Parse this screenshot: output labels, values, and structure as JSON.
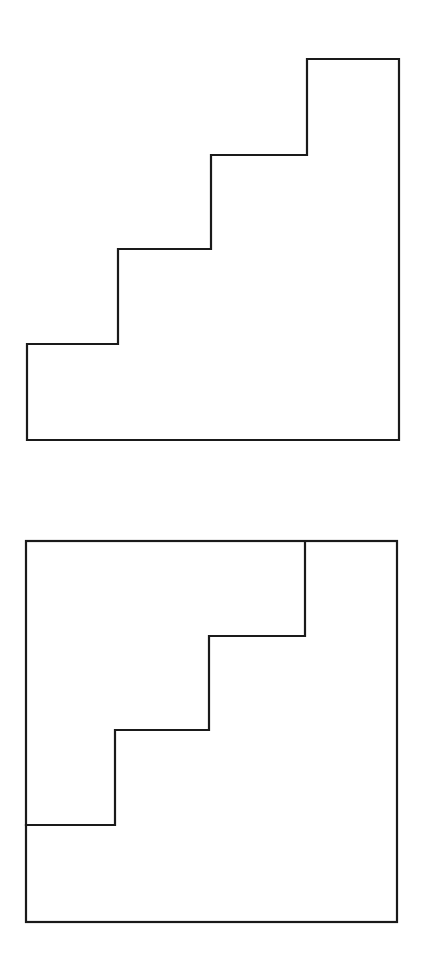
{
  "diagram": {
    "stroke_color": "#1a1a1a",
    "background_color": "#ffffff",
    "figures": [
      {
        "name": "staircase-shape",
        "steps": 4,
        "points": [
          [
            27,
            59
          ],
          [
            307,
            59
          ],
          [
            307,
            155
          ],
          [
            211,
            155
          ],
          [
            211,
            249
          ],
          [
            118,
            249
          ],
          [
            118,
            344
          ],
          [
            27,
            344
          ],
          [
            27,
            440
          ],
          [
            399,
            440
          ],
          [
            399,
            59
          ]
        ]
      },
      {
        "name": "square-with-staircase-division",
        "box": {
          "x": 26,
          "y": 541,
          "width": 371,
          "height": 381
        },
        "staircase_points": [
          [
            26,
            825
          ],
          [
            115,
            825
          ],
          [
            115,
            730
          ],
          [
            209,
            730
          ],
          [
            209,
            636
          ],
          [
            305,
            636
          ],
          [
            305,
            542
          ]
        ]
      }
    ]
  }
}
